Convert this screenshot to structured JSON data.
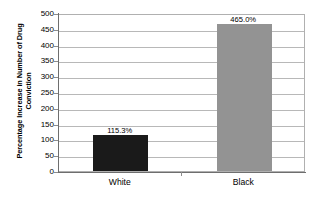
{
  "chart_data": {
    "type": "bar",
    "title": "",
    "xlabel": "",
    "ylabel_line1": "Percentage Increase in Number of Drug",
    "ylabel_line2": "Conviction",
    "ylabel": "Percentage Increase in Number of Drug Conviction",
    "categories": [
      "White",
      "Black"
    ],
    "values": [
      115.3,
      465.0
    ],
    "data_labels": [
      "115.3%",
      "465.0%"
    ],
    "bar_colors": [
      "#1a1a1a",
      "#939393"
    ],
    "ylim": [
      0,
      500
    ],
    "ytick_values": [
      500,
      450,
      400,
      350,
      300,
      250,
      200,
      150,
      100,
      50,
      0
    ],
    "ytick_labels": [
      "500",
      "450",
      "400",
      "350",
      "300",
      "250",
      "200",
      "150",
      "100",
      "50",
      "0"
    ],
    "grid": true,
    "grid_axis": "y",
    "legend": false,
    "legend_position": "none",
    "plot_border_color": "#b0b0b0",
    "gridline_color": "#b8b8b8",
    "axis_color": "#6e6e6e"
  }
}
